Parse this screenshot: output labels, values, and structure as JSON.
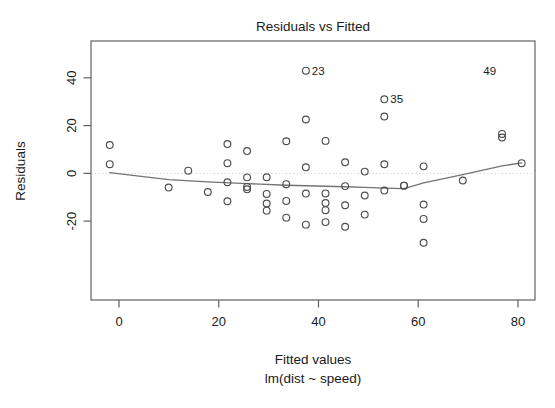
{
  "chart_data": {
    "type": "scatter",
    "title": "Residuals vs Fitted",
    "xlabel": "Fitted values",
    "sublabel": "lm(dist ~ speed)",
    "ylabel": "Residuals",
    "xlim": [
      -6,
      86
    ],
    "ylim": [
      -36,
      50
    ],
    "xticks": [
      0,
      20,
      40,
      60,
      80
    ],
    "yticks": [
      40,
      20,
      0,
      -20
    ],
    "xtick_labels": [
      "0",
      "20",
      "40",
      "60",
      "80"
    ],
    "ytick_labels": [
      "40",
      "20",
      "0",
      "-20"
    ],
    "grid": false,
    "legend": "none",
    "reference_line": {
      "y": 0,
      "style": "dotted",
      "color": "#c9c9c9"
    },
    "point_style": {
      "marker": "open-circle",
      "radius": 3.4,
      "color": "#4d4d4d"
    },
    "x": [
      -1.85,
      -1.85,
      9.95,
      13.88,
      17.81,
      21.74,
      21.74,
      21.74,
      21.74,
      25.68,
      25.68,
      25.68,
      25.68,
      29.61,
      29.61,
      29.61,
      29.61,
      33.54,
      33.54,
      33.54,
      33.54,
      37.47,
      37.47,
      37.47,
      37.47,
      37.47,
      41.41,
      41.41,
      41.41,
      41.41,
      41.41,
      45.34,
      45.34,
      45.34,
      45.34,
      49.27,
      49.27,
      49.27,
      53.2,
      53.2,
      53.2,
      53.2,
      57.14,
      57.14,
      61.07,
      61.07,
      61.07,
      61.07,
      68.93,
      76.8,
      76.8,
      80.73
    ],
    "y": [
      3.85,
      11.85,
      -5.95,
      1.12,
      -7.81,
      -3.74,
      4.26,
      12.26,
      -11.68,
      -6.68,
      -1.68,
      9.32,
      -5.68,
      -15.61,
      -12.61,
      -8.61,
      -1.61,
      -18.54,
      -11.54,
      -4.54,
      13.46,
      -21.47,
      -8.47,
      2.53,
      22.53,
      43.0,
      -20.41,
      -15.41,
      -8.41,
      13.59,
      -12.41,
      -22.34,
      -13.34,
      4.66,
      -5.34,
      -17.27,
      -9.27,
      0.73,
      -7.2,
      3.8,
      23.8,
      31.0,
      -5.14,
      -5.14,
      -29.07,
      -19.07,
      -13.07,
      2.93,
      -3.0,
      15.0,
      16.5,
      4.27
    ],
    "labeled_points": [
      {
        "label": "23",
        "x": 37.47,
        "y": 43.0
      },
      {
        "label": "35",
        "x": 53.2,
        "y": 31.0
      },
      {
        "label": "49",
        "x": 76.8,
        "y": 43.0
      }
    ],
    "smooth_curve": {
      "method": "lowess",
      "x": [
        -1.85,
        9.95,
        17.81,
        25.68,
        33.54,
        41.41,
        45.34,
        49.27,
        53.2,
        57.14,
        61.07,
        68.93,
        76.8,
        80.73
      ],
      "y": [
        0.3,
        -2.6,
        -3.6,
        -4.3,
        -5.0,
        -5.4,
        -5.6,
        -5.9,
        -6.2,
        -6.4,
        -4.0,
        -0.5,
        3.1,
        4.4
      ]
    }
  }
}
